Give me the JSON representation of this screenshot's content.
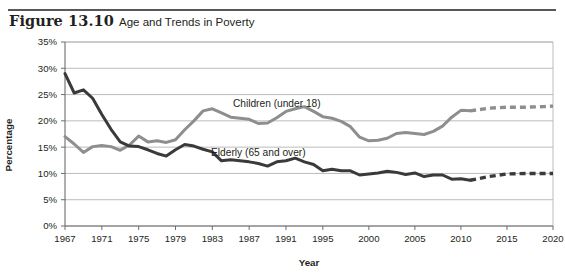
{
  "figure": {
    "number": "Figure 13.10",
    "title": "Age and Trends in Poverty"
  },
  "colors": {
    "children_line": "#8e8e8e",
    "elderly_line": "#3a3a3a",
    "gridline": "#b4b4b4",
    "axis": "#6d6d6d",
    "text": "#231f20",
    "rule": "#58585b",
    "background": "#ffffff"
  },
  "chart_data": {
    "type": "line",
    "title": "Age and Trends in Poverty",
    "xlabel": "Year",
    "ylabel": "Percentage",
    "xlim": [
      1967,
      2020
    ],
    "ylim": [
      0,
      35
    ],
    "ytick_labels": [
      "0%",
      "5%",
      "10%",
      "15%",
      "20%",
      "25%",
      "30%",
      "35%"
    ],
    "ytick_values": [
      0,
      5,
      10,
      15,
      20,
      25,
      30,
      35
    ],
    "xtick_labels": [
      "1967",
      "1971",
      "1975",
      "1979",
      "1983",
      "1987",
      "1991",
      "1995",
      "2000",
      "2005",
      "2010",
      "2015",
      "2020"
    ],
    "xtick_values": [
      1967,
      1971,
      1975,
      1979,
      1983,
      1987,
      1991,
      1995,
      2000,
      2005,
      2010,
      2015,
      2020
    ],
    "grid": "horizontal",
    "legend": "inline-labels",
    "series": [
      {
        "name": "Children (under 18)",
        "color": "#8e8e8e",
        "label_x": 1990,
        "label_y": 22.6,
        "solid": {
          "x": [
            1967,
            1968,
            1969,
            1970,
            1971,
            1972,
            1973,
            1974,
            1975,
            1976,
            1977,
            1978,
            1979,
            1980,
            1981,
            1982,
            1983,
            1984,
            1985,
            1986,
            1987,
            1988,
            1989,
            1990,
            1991,
            1992,
            1993,
            1994,
            1995,
            1996,
            1997,
            1998,
            1999,
            2000,
            2001,
            2002,
            2003,
            2004,
            2005,
            2006,
            2007,
            2008,
            2009,
            2010,
            2011
          ],
          "y": [
            17.0,
            15.6,
            14.0,
            15.1,
            15.3,
            15.1,
            14.4,
            15.4,
            17.1,
            16.0,
            16.2,
            15.9,
            16.4,
            18.3,
            20.0,
            21.9,
            22.3,
            21.5,
            20.7,
            20.5,
            20.3,
            19.5,
            19.6,
            20.6,
            21.8,
            22.3,
            22.7,
            21.8,
            20.8,
            20.5,
            19.9,
            18.9,
            16.9,
            16.2,
            16.3,
            16.7,
            17.6,
            17.8,
            17.6,
            17.4,
            18.0,
            19.0,
            20.7,
            22.0,
            21.9
          ]
        },
        "projected": {
          "x": [
            2011,
            2013,
            2015,
            2017,
            2019,
            2020
          ],
          "y": [
            21.9,
            22.4,
            22.6,
            22.6,
            22.7,
            22.8
          ]
        }
      },
      {
        "name": "Elderly (65 and over)",
        "color": "#3a3a3a",
        "label_x": 1988,
        "label_y": 13.4,
        "solid": {
          "x": [
            1967,
            1968,
            1969,
            1970,
            1971,
            1972,
            1973,
            1974,
            1975,
            1976,
            1977,
            1978,
            1979,
            1980,
            1981,
            1982,
            1983,
            1984,
            1985,
            1986,
            1987,
            1988,
            1989,
            1990,
            1991,
            1992,
            1993,
            1994,
            1995,
            1996,
            1997,
            1998,
            1999,
            2000,
            2001,
            2002,
            2003,
            2004,
            2005,
            2006,
            2007,
            2008,
            2009,
            2010,
            2011
          ],
          "y": [
            29.0,
            25.3,
            25.9,
            24.3,
            21.2,
            18.4,
            16.0,
            15.2,
            15.1,
            14.5,
            13.8,
            13.3,
            14.5,
            15.5,
            15.2,
            14.6,
            14.1,
            12.4,
            12.6,
            12.4,
            12.2,
            11.9,
            11.4,
            12.2,
            12.4,
            12.9,
            12.2,
            11.7,
            10.5,
            10.8,
            10.5,
            10.5,
            9.7,
            9.9,
            10.1,
            10.4,
            10.2,
            9.8,
            10.1,
            9.4,
            9.7,
            9.7,
            8.9,
            9.0,
            8.7
          ]
        },
        "projected": {
          "x": [
            2011,
            2013,
            2015,
            2017,
            2019,
            2020
          ],
          "y": [
            8.7,
            9.4,
            9.9,
            10.0,
            10.0,
            10.0
          ]
        }
      }
    ]
  }
}
